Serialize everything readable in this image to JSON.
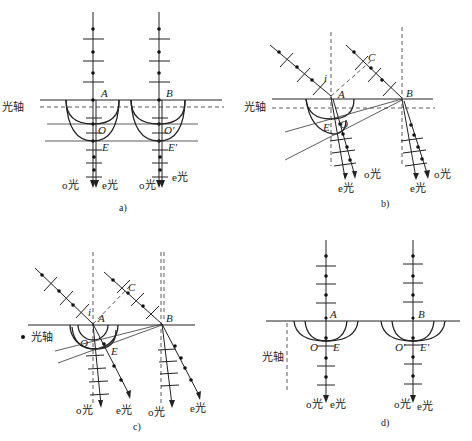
{
  "figure": {
    "panels": [
      {
        "id": "a",
        "caption": "a)",
        "optic_axis_label": "光轴",
        "points": [
          "A",
          "B",
          "O",
          "O′",
          "E",
          "E′"
        ],
        "ray_labels": [
          "o光",
          "e光",
          "o光",
          "e光"
        ]
      },
      {
        "id": "b",
        "caption": "b)",
        "optic_axis_label": "光轴",
        "points": [
          "A",
          "B",
          "C",
          "O",
          "E",
          "i"
        ],
        "ray_labels": [
          "o光",
          "e光",
          "o光",
          "e光"
        ]
      },
      {
        "id": "c",
        "caption": "c)",
        "optic_axis_label": "光轴",
        "points": [
          "A",
          "B",
          "C",
          "O",
          "E",
          "i"
        ],
        "ray_labels": [
          "o光",
          "e光",
          "o光",
          "e光"
        ]
      },
      {
        "id": "d",
        "caption": "d)",
        "optic_axis_label": "光轴",
        "points": [
          "A",
          "B",
          "O",
          "O′",
          "E",
          "E′"
        ],
        "ray_labels": [
          "o光",
          "e光",
          "o光",
          "e光"
        ]
      }
    ]
  },
  "labels": {
    "axis": "光轴",
    "o_light": "o光",
    "e_light": "e光",
    "A": "A",
    "B": "B",
    "C": "C",
    "O": "O",
    "O_prime": "O′",
    "E": "E",
    "E_prime": "E′",
    "i": "i",
    "cap_a": "a)",
    "cap_b": "b)",
    "cap_c": "c)",
    "cap_d": "d)"
  }
}
